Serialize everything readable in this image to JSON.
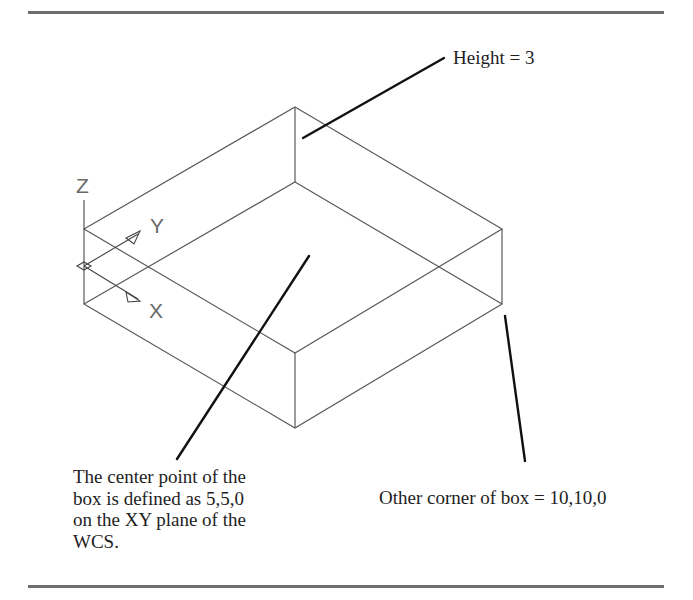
{
  "figure": {
    "labels": {
      "height": "Height = 3",
      "other_corner": "Other corner of box = 10,10,0",
      "center_point_lines": [
        "The center point of the",
        "box is defined as 5,5,0",
        "on the XY plane of the",
        "WCS."
      ]
    },
    "ucs_icon": {
      "z_label": "Z",
      "y_label": "Y",
      "x_label": "X"
    },
    "colors": {
      "box_edges": "#5a5a5a",
      "leader_lines": "#111111",
      "rules": "#6e6e6e",
      "text": "#1e1e1e"
    }
  }
}
